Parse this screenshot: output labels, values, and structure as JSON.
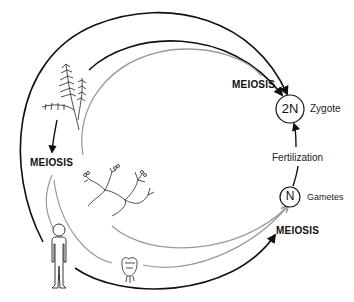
{
  "diagram": {
    "type": "life-cycle",
    "labels": {
      "meiosis_top": "MEIOSIS",
      "meiosis_left": "MEIOSIS",
      "meiosis_bottom": "MEIOSIS",
      "fertilization": "Fertilization",
      "zygote": "Zygote",
      "gametes": "Gametes"
    },
    "nodes": {
      "diploid": {
        "symbol": "2N",
        "label": "Zygote"
      },
      "haploid": {
        "symbol": "N",
        "label": "Gametes"
      }
    },
    "organisms": [
      "fern-icon",
      "alga-icon",
      "fungus-icon",
      "human-icon"
    ],
    "colors": {
      "black_path": "#111111",
      "gray_path": "#9a9a9a"
    }
  }
}
